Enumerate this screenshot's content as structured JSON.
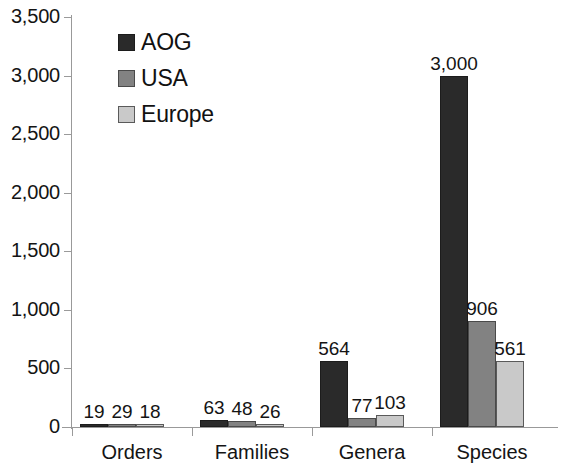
{
  "chart_data": {
    "type": "bar",
    "title": "",
    "subtitle": "",
    "xlabel": "",
    "ylabel": "",
    "categories": [
      "Orders",
      "Families",
      "Genera",
      "Species"
    ],
    "series": [
      {
        "name": "AOG",
        "color": "#2a2a2a",
        "values": [
          19,
          63,
          564,
          3000
        ]
      },
      {
        "name": "USA",
        "color": "#828282",
        "values": [
          29,
          48,
          77,
          906
        ]
      },
      {
        "name": "Europe",
        "color": "#c9c9c9",
        "values": [
          18,
          26,
          103,
          561
        ]
      }
    ],
    "value_labels": [
      [
        "19",
        "29",
        "18"
      ],
      [
        "63",
        "48",
        "26"
      ],
      [
        "564",
        "77",
        "103"
      ],
      [
        "3,000",
        "906",
        "561"
      ]
    ],
    "ylim": [
      0,
      3500
    ],
    "ytick_values": [
      0,
      500,
      1000,
      1500,
      2000,
      2500,
      3000,
      3500
    ],
    "ytick_labels": [
      "0",
      "500",
      "1,000",
      "1,500",
      "2,000",
      "2,500",
      "3,000",
      "3,500"
    ],
    "grid": false,
    "legend_position": "top-left-inside",
    "legend_entries": [
      "AOG",
      "USA",
      "Europe"
    ],
    "bar_style": "grouped"
  }
}
